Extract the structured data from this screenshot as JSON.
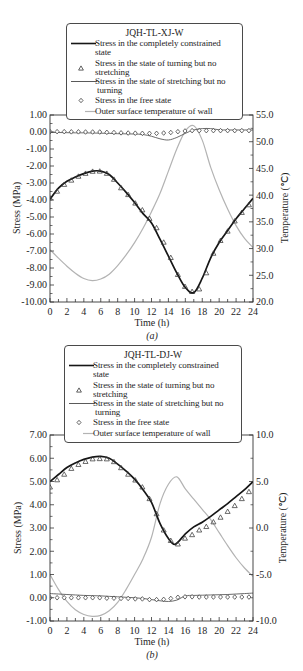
{
  "chart_data": [
    {
      "type": "line",
      "title": "JQH-TL-XJ-W",
      "caption": "(a)",
      "xlabel": "Time (h)",
      "ylabel": "Stress (MPa)",
      "y2label": "Temperature (℃)",
      "xlim": [
        0,
        24
      ],
      "ylim": [
        -10,
        1
      ],
      "y2lim": [
        20,
        55
      ],
      "grid": false,
      "legend_position": "top-center",
      "xticks": [
        "0",
        "2",
        "4",
        "6",
        "8",
        "10",
        "12",
        "14",
        "16",
        "18",
        "20",
        "22",
        "24"
      ],
      "yticks": [
        "1.00",
        "0.00",
        "-1.00",
        "-2.00",
        "-3.00",
        "-4.00",
        "-5.00",
        "-6.00",
        "-7.00",
        "-8.00",
        "-9.00",
        "-10.00"
      ],
      "y2ticks": [
        "55.0",
        "50.0",
        "45.0",
        "40.0",
        "35.0",
        "30.0",
        "25.0",
        "20.0"
      ],
      "legend": {
        "title": "JQH-TL-XJ-W",
        "items": [
          {
            "line1": "Stress in the completely constrained",
            "line2": "state",
            "symbol": "solid-line"
          },
          {
            "line1": "Stress in the state of turning but no",
            "line2": "stretching",
            "symbol": "triangle"
          },
          {
            "line1": "Stress in the state of stretching but no",
            "line2": "turning",
            "symbol": "thin-line"
          },
          {
            "line1": "Stress in the free state",
            "symbol": "diamond"
          },
          {
            "line1": "Outer surface temperature of wall",
            "symbol": "light-line"
          }
        ]
      },
      "series": [
        {
          "name": "Outer surface temperature of wall",
          "axis": "right",
          "style": "line",
          "color": "#b3b3b3",
          "width": 1.2,
          "x": [
            0,
            1,
            2,
            3,
            4,
            5,
            6,
            7,
            8,
            9,
            10,
            11,
            12,
            13,
            14,
            15,
            16,
            17,
            18,
            19,
            20,
            21,
            22,
            23,
            24
          ],
          "values": [
            29.8,
            28.2,
            26.7,
            25.4,
            24.4,
            24.0,
            24.3,
            25.2,
            26.8,
            28.8,
            31.1,
            33.8,
            36.9,
            40.3,
            44.5,
            48.7,
            52.0,
            53.0,
            50.3,
            45.2,
            41.0,
            37.4,
            34.3,
            31.9,
            30.2
          ]
        },
        {
          "name": "Stress in the state of stretching but no turning",
          "axis": "left",
          "style": "line",
          "color": "#5a5a5a",
          "width": 0.9,
          "x": [
            0,
            1,
            2,
            3,
            4,
            5,
            6,
            7,
            8,
            9,
            10,
            11,
            12,
            13,
            14,
            15,
            16,
            17,
            18,
            19,
            20,
            21,
            22,
            23,
            24
          ],
          "values": [
            -0.03,
            -0.03,
            -0.04,
            -0.05,
            -0.05,
            -0.06,
            -0.07,
            -0.08,
            -0.1,
            -0.11,
            -0.12,
            -0.15,
            -0.25,
            -0.4,
            -0.47,
            -0.32,
            -0.08,
            0.12,
            0.2,
            0.2,
            0.13,
            0.12,
            0.12,
            0.12,
            0.12
          ]
        },
        {
          "name": "Stress in the completely constrained state",
          "axis": "left",
          "style": "line",
          "color": "#161616",
          "width": 1.7,
          "x": [
            0,
            1,
            2,
            3,
            4,
            5,
            6,
            7,
            8,
            9,
            10,
            11,
            12,
            13,
            14,
            15,
            16,
            17,
            18,
            19,
            20,
            21,
            22,
            23,
            24
          ],
          "values": [
            -3.95,
            -3.3,
            -2.9,
            -2.65,
            -2.45,
            -2.3,
            -2.3,
            -2.5,
            -3.0,
            -3.55,
            -4.15,
            -4.8,
            -5.35,
            -6.3,
            -7.3,
            -8.3,
            -9.15,
            -9.45,
            -8.6,
            -7.4,
            -6.5,
            -5.8,
            -5.1,
            -4.5,
            -3.9
          ]
        },
        {
          "name": "Stress in the state of turning but no stretching",
          "axis": "left",
          "style": "triangle",
          "color": "#3a3a3a",
          "x": [
            0,
            0.84,
            1.68,
            2.52,
            3.36,
            4.2,
            5.04,
            5.88,
            6.72,
            7.56,
            8.4,
            9.24,
            10.08,
            10.92,
            11.76,
            12.6,
            13.44,
            14.28,
            15.12,
            15.96,
            16.8,
            17.64,
            18.48,
            19.32,
            20.16,
            21.0,
            21.84,
            22.68,
            23.52
          ],
          "values": [
            -3.9,
            -3.5,
            -3.1,
            -2.85,
            -2.62,
            -2.45,
            -2.33,
            -2.32,
            -2.45,
            -2.8,
            -3.3,
            -3.7,
            -4.2,
            -4.6,
            -5.1,
            -5.65,
            -6.5,
            -7.4,
            -8.4,
            -9.1,
            -9.4,
            -9.25,
            -8.3,
            -7.15,
            -6.4,
            -5.85,
            -5.25,
            -4.75,
            -4.3
          ]
        },
        {
          "name": "Stress in the free state",
          "axis": "left",
          "style": "diamond",
          "color": "#3a3a3a",
          "x": [
            0,
            0.84,
            1.68,
            2.52,
            3.36,
            4.2,
            5.04,
            5.88,
            6.72,
            7.56,
            8.4,
            9.24,
            10.08,
            10.92,
            11.76,
            12.6,
            13.44,
            14.28,
            15.12,
            15.96,
            16.8,
            17.64,
            18.48,
            19.32,
            20.16,
            21.0,
            21.84,
            22.68,
            23.52
          ],
          "values": [
            0.02,
            0.02,
            0.02,
            0.01,
            0.01,
            0.0,
            0.0,
            0.0,
            -0.02,
            -0.03,
            -0.05,
            -0.06,
            -0.07,
            -0.08,
            -0.08,
            -0.08,
            -0.06,
            -0.03,
            0.02,
            0.06,
            0.08,
            0.08,
            0.08,
            0.08,
            0.08,
            0.08,
            0.08,
            0.08,
            0.08
          ]
        }
      ]
    },
    {
      "type": "line",
      "title": "JQH-TL-DJ-W",
      "caption": "(b)",
      "xlabel": "Time (h)",
      "ylabel": "Stress (MPa)",
      "y2label": "Temperature (℃)",
      "xlim": [
        0,
        24
      ],
      "ylim": [
        -1,
        7
      ],
      "y2lim": [
        -10,
        10
      ],
      "grid": false,
      "legend_position": "top-center",
      "xticks": [
        "0",
        "2",
        "4",
        "6",
        "8",
        "10",
        "12",
        "14",
        "16",
        "18",
        "20",
        "22",
        "24"
      ],
      "yticks": [
        "7.00",
        "6.00",
        "5.00",
        "4.00",
        "3.00",
        "2.00",
        "1.00",
        "0.00",
        "-1.00"
      ],
      "y2ticks": [
        "10.0",
        "5.0",
        "0.0",
        "-5.0",
        "-10.0"
      ],
      "legend": {
        "title": "JQH-TL-DJ-W",
        "items": [
          {
            "line1": "Stress in the completely constrained",
            "line2": "state",
            "symbol": "solid-line"
          },
          {
            "line1": "Stress in the state of turning but no",
            "line2": "stretching",
            "symbol": "triangle"
          },
          {
            "line1": "Stress in the state of stretching but no",
            "line2": "turning",
            "symbol": "thin-line"
          },
          {
            "line1": "Stress in the free state",
            "symbol": "diamond"
          },
          {
            "line1": "Outer surface temperature of wall",
            "symbol": "light-line"
          }
        ]
      },
      "series": [
        {
          "name": "Outer surface temperature of wall",
          "axis": "right",
          "style": "line",
          "color": "#b3b3b3",
          "width": 1.2,
          "x": [
            0,
            1,
            2,
            3,
            4,
            5,
            6,
            7,
            8,
            9,
            10,
            11,
            12,
            13,
            14,
            15,
            16,
            17,
            18,
            19,
            20,
            21,
            22,
            23,
            24
          ],
          "values": [
            -5.0,
            -6.6,
            -7.9,
            -8.8,
            -9.3,
            -9.5,
            -9.4,
            -8.9,
            -8.0,
            -6.6,
            -5.0,
            -3.3,
            -1.0,
            2.6,
            4.7,
            5.5,
            4.2,
            3.1,
            2.0,
            0.9,
            -0.5,
            -1.9,
            -3.2,
            -4.3,
            -5.2
          ]
        },
        {
          "name": "Stress in the state of stretching but no turning",
          "axis": "left",
          "style": "line",
          "color": "#5a5a5a",
          "width": 0.9,
          "x": [
            0,
            1,
            2,
            3,
            4,
            5,
            6,
            7,
            8,
            9,
            10,
            11,
            12,
            13,
            14,
            15,
            16,
            17,
            18,
            19,
            20,
            21,
            22,
            23,
            24
          ],
          "values": [
            0.18,
            0.16,
            0.14,
            0.12,
            0.1,
            0.09,
            0.08,
            0.06,
            0.04,
            0.02,
            0.0,
            -0.03,
            -0.08,
            -0.13,
            -0.16,
            -0.1,
            0.08,
            0.1,
            0.11,
            0.12,
            0.13,
            0.14,
            0.16,
            0.18,
            0.2
          ]
        },
        {
          "name": "Stress in the completely constrained state",
          "axis": "left",
          "style": "line",
          "color": "#161616",
          "width": 1.7,
          "x": [
            0,
            1,
            2,
            3,
            4,
            5,
            6,
            7,
            8,
            9,
            10,
            11,
            12,
            13,
            14,
            14.8,
            16,
            17,
            18,
            19,
            20,
            21,
            22,
            23,
            24
          ],
          "values": [
            5.0,
            5.3,
            5.6,
            5.8,
            5.95,
            6.05,
            6.08,
            6.0,
            5.75,
            5.45,
            5.1,
            4.65,
            4.1,
            3.2,
            2.55,
            2.3,
            2.75,
            3.05,
            3.25,
            3.5,
            3.78,
            4.05,
            4.35,
            4.65,
            5.0
          ]
        },
        {
          "name": "Stress in the state of turning but no stretching",
          "axis": "left",
          "style": "triangle",
          "color": "#3a3a3a",
          "x": [
            0,
            0.84,
            1.68,
            2.52,
            3.36,
            4.2,
            5.04,
            5.88,
            6.72,
            7.56,
            8.4,
            9.24,
            10.08,
            10.92,
            11.76,
            12.6,
            13.44,
            14.28,
            15.12,
            15.96,
            16.8,
            17.64,
            18.48,
            19.32,
            20.16,
            21.0,
            21.84,
            22.68,
            23.52
          ],
          "values": [
            4.75,
            5.06,
            5.3,
            5.55,
            5.72,
            5.85,
            5.96,
            5.97,
            5.96,
            5.84,
            5.58,
            5.3,
            5.05,
            4.75,
            4.25,
            3.6,
            2.9,
            2.45,
            2.3,
            2.55,
            2.7,
            2.9,
            3.05,
            3.25,
            3.45,
            3.7,
            3.95,
            4.25,
            4.55
          ]
        },
        {
          "name": "Stress in the free state",
          "axis": "left",
          "style": "diamond",
          "color": "#3a3a3a",
          "x": [
            0,
            0.84,
            1.68,
            2.52,
            3.36,
            4.2,
            5.04,
            5.88,
            6.72,
            7.56,
            8.4,
            9.24,
            10.08,
            10.92,
            11.76,
            12.6,
            13.44,
            14.28,
            15.12,
            15.96,
            16.8,
            17.64,
            18.48,
            19.32,
            20.16,
            21.0,
            21.84,
            22.68,
            23.52
          ],
          "values": [
            0,
            0,
            0,
            0,
            0,
            0,
            0,
            0,
            -0.02,
            -0.02,
            -0.03,
            -0.03,
            -0.05,
            -0.05,
            -0.08,
            -0.08,
            -0.07,
            -0.03,
            0.02,
            0.04,
            0.04,
            0.03,
            0.03,
            0.03,
            0.03,
            0.03,
            0.03,
            0.03,
            0.03
          ]
        }
      ]
    }
  ]
}
